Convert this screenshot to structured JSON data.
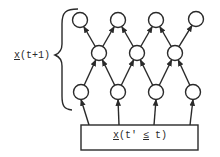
{
  "diagram": {
    "left_label": {
      "var": "x",
      "suffix": "(t+1)"
    },
    "box_label": {
      "var": "x",
      "mid": "(t' ",
      "rel": "≤",
      "tail": " t)"
    },
    "colors": {
      "stroke": "#2a2a2a",
      "background": "#ffffff"
    },
    "layers": {
      "top": [
        [
          80,
          20
        ],
        [
          118,
          20
        ],
        [
          156,
          20
        ],
        [
          196,
          19
        ]
      ],
      "middle": [
        [
          99,
          53
        ],
        [
          137,
          53
        ],
        [
          175,
          53
        ]
      ],
      "bottom": [
        [
          81,
          92
        ],
        [
          118,
          92
        ],
        [
          156,
          92
        ],
        [
          193,
          92
        ]
      ]
    },
    "box": {
      "x": 81,
      "y": 125,
      "w": 117,
      "h": 25
    }
  }
}
